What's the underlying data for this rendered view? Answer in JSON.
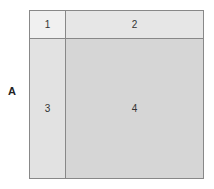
{
  "row_label": "A",
  "cells": [
    {
      "id": 1,
      "label": "1"
    },
    {
      "id": 2,
      "label": "2"
    },
    {
      "id": 3,
      "label": "3"
    },
    {
      "id": 4,
      "label": "4"
    }
  ]
}
